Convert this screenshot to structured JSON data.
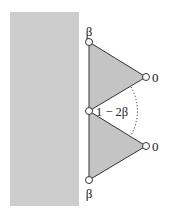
{
  "diagram": {
    "width": 173,
    "height": 217,
    "colors": {
      "background": "#ffffff",
      "wall_fill": "#cdcdcd",
      "triangle_fill": "#c4c4c4",
      "stroke": "#333333",
      "node_fill": "#ffffff",
      "text": "#222222"
    },
    "wall": {
      "x": 10,
      "y": 12,
      "width": 69,
      "height": 194
    },
    "nodes": [
      {
        "id": "top",
        "x": 89,
        "y": 42,
        "label": "β"
      },
      {
        "id": "right-upper",
        "x": 146,
        "y": 77,
        "label": "0"
      },
      {
        "id": "middle",
        "x": 89,
        "y": 111,
        "label": ""
      },
      {
        "id": "right-lower",
        "x": 146,
        "y": 146,
        "label": "0"
      },
      {
        "id": "bottom",
        "x": 89,
        "y": 180,
        "label": "β"
      }
    ],
    "triangles": [
      {
        "name": "upper-triangle",
        "vertices": [
          "top",
          "right-upper",
          "middle"
        ]
      },
      {
        "name": "lower-triangle",
        "vertices": [
          "middle",
          "right-lower",
          "bottom"
        ]
      }
    ],
    "angle_annotation": {
      "vertex": "middle",
      "label": "1 − 2β",
      "style": "dotted-arc"
    },
    "labels": {
      "top_beta": "β",
      "bottom_beta": "β",
      "upper_zero": "0",
      "lower_zero": "0",
      "angle": "1 − 2β"
    }
  }
}
